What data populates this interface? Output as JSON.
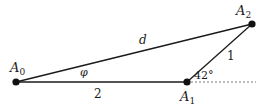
{
  "diagram": {
    "points": {
      "A0": {
        "label": "A",
        "sub": "0"
      },
      "A1": {
        "label": "A",
        "sub": "1"
      },
      "A2": {
        "label": "A",
        "sub": "2"
      }
    },
    "edges": {
      "A0_A1": "2",
      "A1_A2": "1",
      "A0_A2": "d"
    },
    "angle_at_A0": "φ",
    "angle_at_A1": "42°"
  }
}
